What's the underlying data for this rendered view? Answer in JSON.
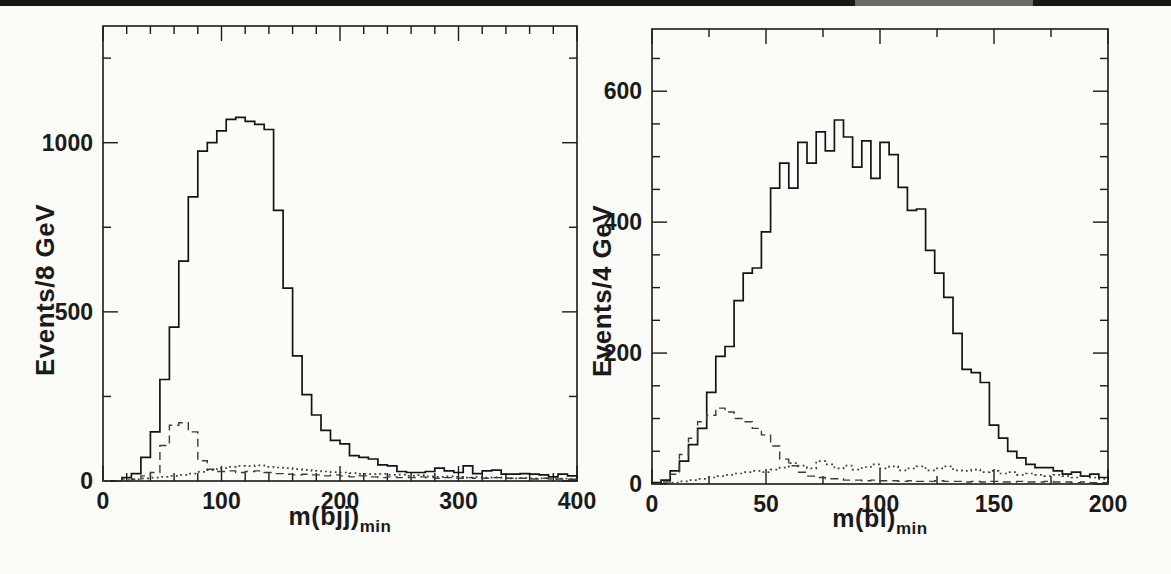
{
  "page": {
    "top_bar_color": "#171717",
    "background": "#fbfbf8"
  },
  "chart_data": [
    {
      "type": "bar",
      "subtype": "step-histogram",
      "name": "mbjj",
      "title": "",
      "x_axis": {
        "label_main": "m(bjj)",
        "label_sub": "min",
        "range": [
          0,
          400
        ],
        "major_ticks": [
          0,
          100,
          200,
          300,
          400
        ],
        "major_tick_labels": [
          "0",
          "100",
          "200",
          "300",
          "400"
        ],
        "minor_step": 20
      },
      "y_axis": {
        "label": "Events/8 GeV",
        "range": [
          0,
          1345
        ],
        "major_ticks": [
          0,
          500,
          1000
        ],
        "major_tick_labels": [
          "0",
          "500",
          "1000"
        ],
        "minor_step": 250
      },
      "bin_start": 0,
      "bin_width": 8,
      "grid": false,
      "legend": false,
      "series": [
        {
          "name": "signal-solid",
          "style": "solid",
          "values": [
            0,
            0,
            10,
            22,
            70,
            145,
            300,
            455,
            650,
            840,
            975,
            1000,
            1035,
            1069,
            1075,
            1063,
            1054,
            1039,
            800,
            570,
            370,
            255,
            195,
            150,
            120,
            110,
            75,
            70,
            65,
            48,
            45,
            28,
            25,
            25,
            28,
            38,
            30,
            25,
            45,
            22,
            30,
            32,
            20,
            20,
            22,
            20,
            18,
            12,
            20,
            15
          ]
        },
        {
          "name": "background-dashed",
          "style": "dashed",
          "values": [
            0,
            0,
            0,
            5,
            15,
            25,
            105,
            165,
            172,
            145,
            60,
            35,
            28,
            30,
            25,
            28,
            30,
            25,
            22,
            20,
            18,
            20,
            18,
            15,
            18,
            15,
            12,
            15,
            12,
            10,
            12,
            10,
            10,
            12,
            10,
            8,
            10,
            8,
            10,
            8,
            8,
            10,
            8,
            8,
            8,
            6,
            8,
            6,
            6,
            5
          ]
        },
        {
          "name": "background-dotted",
          "style": "dotted",
          "values": [
            0,
            0,
            3,
            5,
            8,
            10,
            12,
            15,
            18,
            22,
            27,
            32,
            38,
            42,
            45,
            44,
            46,
            42,
            40,
            38,
            35,
            33,
            30,
            28,
            26,
            25,
            23,
            21,
            20,
            21,
            18,
            19,
            15,
            17,
            14,
            12,
            14,
            12,
            10,
            12,
            10,
            11,
            10,
            8,
            9,
            8,
            8,
            6,
            7,
            6
          ]
        }
      ]
    },
    {
      "type": "bar",
      "subtype": "step-histogram",
      "name": "mbl",
      "title": "",
      "x_axis": {
        "label_main": "m(bl)",
        "label_sub": "min",
        "range": [
          0,
          200
        ],
        "major_ticks": [
          0,
          50,
          100,
          150,
          200
        ],
        "major_tick_labels": [
          "0",
          "50",
          "100",
          "150",
          "200"
        ],
        "minor_step": 25
      },
      "y_axis": {
        "label": "Events/4 GeV",
        "range": [
          0,
          695
        ],
        "major_ticks": [
          0,
          200,
          400,
          600
        ],
        "major_tick_labels": [
          "0",
          "200",
          "400",
          "600"
        ],
        "minor_step": 50
      },
      "bin_start": 0,
      "bin_width": 4,
      "grid": false,
      "legend": false,
      "series": [
        {
          "name": "signal-solid",
          "style": "solid",
          "values": [
            2,
            6,
            20,
            35,
            60,
            85,
            140,
            195,
            210,
            280,
            322,
            330,
            385,
            452,
            490,
            452,
            522,
            490,
            538,
            509,
            556,
            530,
            484,
            524,
            467,
            522,
            503,
            453,
            418,
            420,
            357,
            322,
            285,
            230,
            175,
            170,
            155,
            90,
            70,
            50,
            40,
            30,
            25,
            25,
            20,
            15,
            18,
            12,
            15,
            10
          ]
        },
        {
          "name": "background-dashed",
          "style": "dashed",
          "values": [
            0,
            3,
            15,
            45,
            70,
            95,
            105,
            116,
            110,
            100,
            95,
            85,
            75,
            58,
            38,
            28,
            18,
            12,
            10,
            8,
            8,
            6,
            6,
            5,
            6,
            5,
            5,
            4,
            5,
            4,
            4,
            5,
            4,
            4,
            3,
            4,
            3,
            4,
            3,
            3,
            4,
            3,
            3,
            4,
            3,
            3,
            2,
            3,
            2,
            2
          ]
        },
        {
          "name": "background-dotted",
          "style": "dotted",
          "values": [
            0,
            0,
            2,
            4,
            6,
            8,
            10,
            12,
            14,
            16,
            18,
            20,
            18,
            22,
            25,
            32,
            28,
            24,
            35,
            30,
            24,
            28,
            22,
            26,
            30,
            24,
            27,
            21,
            24,
            27,
            21,
            24,
            27,
            21,
            20,
            22,
            18,
            20,
            16,
            18,
            14,
            16,
            14,
            12,
            14,
            12,
            10,
            12,
            10,
            8
          ]
        }
      ]
    }
  ]
}
